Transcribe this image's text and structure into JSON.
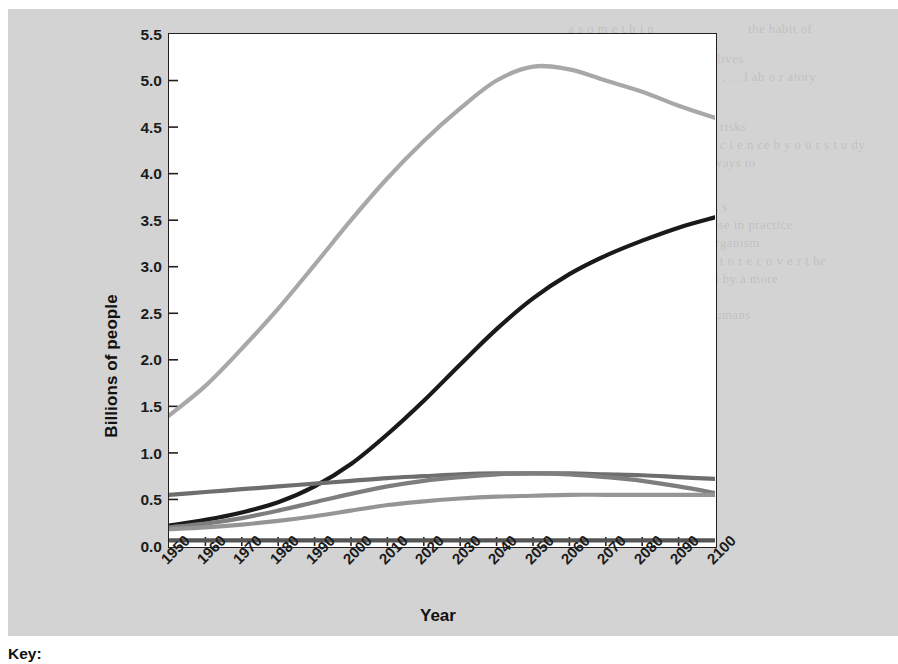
{
  "figure": {
    "background_color": "#d3d3d3",
    "plot_background_color": "#ffffff",
    "border_color": "#231f20",
    "key_label": "Key:"
  },
  "ghost_text": [
    "the habit of",
    "a s o m e  t h i n",
    "a high potential to save man lives",
    "d control. We . . . . . . . . . . . . . . .  l ab o r atory",
    "the early stag",
    "In addition to reducing these risks",
    "bacteria that are 100 years,  s c i e n ce  b y  o u r  s t u dy",
    "that can stop this effort and ways to",
    "A study of the map analysis  i s",
    "nutritional and too long misuse in practice",
    "in the body as a composite organism",
    "for years. Stressed,  s t r e s s  t o  r e c o v e r  t he",
    "the world could be supported by a more",
    "on the",
    "and 2100 to be billions for humans"
  ],
  "chart_data": {
    "type": "line",
    "title": "",
    "xlabel": "Year",
    "ylabel": "Billions of people",
    "xlim": [
      1950,
      2100
    ],
    "ylim": [
      0.0,
      5.5
    ],
    "grid": false,
    "legend_position": "below-chart",
    "x_tick_labels": [
      "1950",
      "1960",
      "1970",
      "1980",
      "1990",
      "2000",
      "2010",
      "2020",
      "2030",
      "2040",
      "2050",
      "2060",
      "2070",
      "2080",
      "2090",
      "2100"
    ],
    "y_tick_labels": [
      "0.0",
      "0.5",
      "1.0",
      "1.5",
      "2.0",
      "2.5",
      "3.0",
      "3.5",
      "4.0",
      "4.5",
      "5.0",
      "5.5"
    ],
    "x": [
      1950,
      1960,
      1970,
      1980,
      1990,
      2000,
      2010,
      2020,
      2030,
      2040,
      2050,
      2060,
      2070,
      2080,
      2090,
      2100
    ],
    "series": [
      {
        "name": "series-light-gray-peak",
        "color": "#a8a8a8",
        "width": 4.2,
        "values": [
          1.4,
          1.72,
          2.12,
          2.55,
          3.02,
          3.5,
          3.95,
          4.35,
          4.7,
          5.0,
          5.15,
          5.12,
          5.0,
          4.88,
          4.73,
          4.6
        ]
      },
      {
        "name": "series-black-rising",
        "color": "#1a1a1a",
        "width": 4.2,
        "values": [
          0.22,
          0.28,
          0.36,
          0.47,
          0.64,
          0.88,
          1.2,
          1.56,
          1.95,
          2.33,
          2.66,
          2.92,
          3.12,
          3.28,
          3.42,
          3.53
        ]
      },
      {
        "name": "series-dark-gray-plateau",
        "color": "#6e6e6e",
        "width": 4.2,
        "values": [
          0.55,
          0.58,
          0.61,
          0.64,
          0.67,
          0.7,
          0.73,
          0.75,
          0.77,
          0.78,
          0.78,
          0.78,
          0.77,
          0.76,
          0.74,
          0.72
        ]
      },
      {
        "name": "series-mid-gray-rising",
        "color": "#7e7e7e",
        "width": 4.2,
        "values": [
          0.2,
          0.24,
          0.3,
          0.38,
          0.47,
          0.56,
          0.64,
          0.7,
          0.74,
          0.77,
          0.78,
          0.77,
          0.74,
          0.7,
          0.64,
          0.57
        ]
      },
      {
        "name": "series-light-mid-gray-flattening",
        "color": "#959595",
        "width": 4.2,
        "values": [
          0.18,
          0.2,
          0.23,
          0.27,
          0.32,
          0.38,
          0.44,
          0.48,
          0.51,
          0.53,
          0.54,
          0.55,
          0.55,
          0.55,
          0.55,
          0.55
        ]
      },
      {
        "name": "series-flat-baseline",
        "color": "#555555",
        "width": 4.2,
        "values": [
          0.06,
          0.06,
          0.06,
          0.06,
          0.06,
          0.06,
          0.06,
          0.06,
          0.06,
          0.06,
          0.06,
          0.06,
          0.06,
          0.06,
          0.06,
          0.06
        ]
      }
    ]
  }
}
